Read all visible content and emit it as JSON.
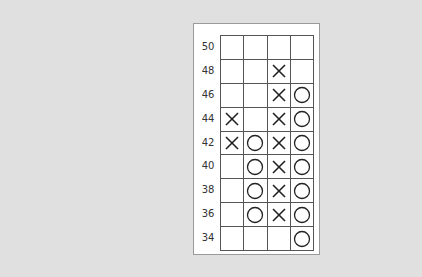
{
  "chart_data": {
    "type": "table",
    "subtype": "point-and-figure",
    "title": "",
    "price_levels": [
      50,
      48,
      46,
      44,
      42,
      40,
      38,
      36,
      34
    ],
    "columns": [
      {
        "index": 0,
        "symbol": "X",
        "levels": [
          44,
          42
        ]
      },
      {
        "index": 1,
        "symbol": "O",
        "levels": [
          42,
          40,
          38,
          36
        ]
      },
      {
        "index": 2,
        "symbol": "X",
        "levels": [
          48,
          46,
          44,
          42,
          40,
          38,
          36
        ]
      },
      {
        "index": 3,
        "symbol": "O",
        "levels": [
          46,
          44,
          42,
          40,
          38,
          36,
          34
        ]
      }
    ],
    "grid": [
      [
        "",
        "",
        "",
        ""
      ],
      [
        "",
        "",
        "X",
        ""
      ],
      [
        "",
        "",
        "X",
        "O"
      ],
      [
        "X",
        "",
        "X",
        "O"
      ],
      [
        "X",
        "O",
        "X",
        "O"
      ],
      [
        "",
        "O",
        "X",
        "O"
      ],
      [
        "",
        "O",
        "X",
        "O"
      ],
      [
        "",
        "O",
        "X",
        "O"
      ],
      [
        "",
        "",
        "",
        "O"
      ]
    ],
    "box_size": 2,
    "ylim": [
      34,
      50
    ]
  },
  "labels": [
    "50",
    "48",
    "46",
    "44",
    "42",
    "40",
    "38",
    "36",
    "34"
  ]
}
